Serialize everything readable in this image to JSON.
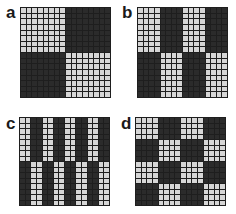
{
  "figure": {
    "colors": {
      "light": "#d6d6d6",
      "dark": "#2b2b2b",
      "gridline": "#1e1e1e",
      "background": "#ffffff"
    },
    "grid_size": 16,
    "panels": [
      {
        "label": "a",
        "block_width": 8,
        "block_height": 8,
        "description": "2x2 checkerboard of 8x8 blocks, top-left light"
      },
      {
        "label": "b",
        "block_width": 4,
        "block_height": 8,
        "description": "4 column blocks x 2 row blocks, top-left light"
      },
      {
        "label": "c",
        "block_width": 2,
        "block_height": 8,
        "description": "8 column blocks x 2 row blocks, top-left light"
      },
      {
        "label": "d",
        "block_width": 4,
        "block_height": 4,
        "description": "4x4 checkerboard of 4x4 blocks, top-left light"
      }
    ]
  }
}
